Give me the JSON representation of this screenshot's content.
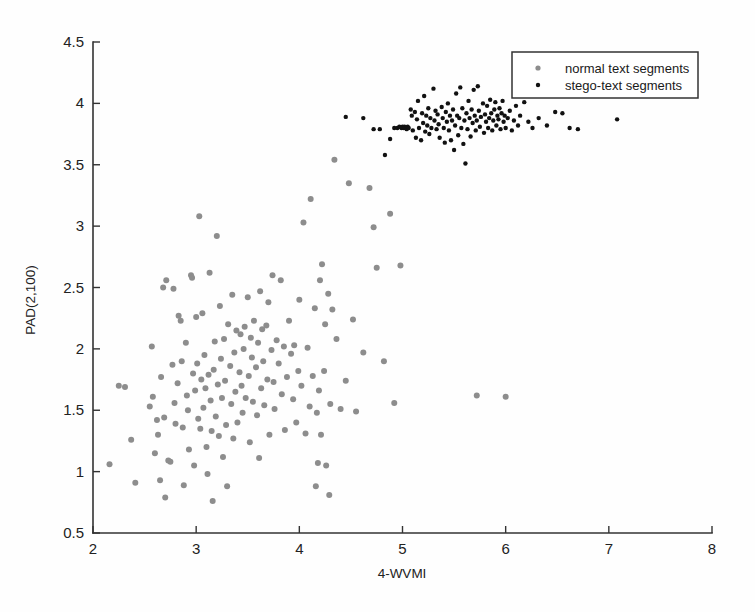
{
  "chart_data": {
    "type": "scatter",
    "title": "",
    "xlabel": "4-WVMI",
    "ylabel": "PAD(2,100)",
    "xlim": [
      2,
      8
    ],
    "ylim": [
      0.5,
      4.5
    ],
    "xticks": [
      "2",
      "3",
      "4",
      "5",
      "6",
      "7",
      "8"
    ],
    "yticks": [
      "0.5",
      "1",
      "1.5",
      "2",
      "2.5",
      "3",
      "3.5",
      "4",
      "4.5"
    ],
    "xtick_values": [
      2,
      3,
      4,
      5,
      6,
      7,
      8
    ],
    "ytick_values": [
      0.5,
      1,
      1.5,
      2,
      2.5,
      3,
      3.5,
      4,
      4.5
    ],
    "grid": false,
    "legend_position": "upper right",
    "series": [
      {
        "name": "normal text segments",
        "marker": "circle",
        "color": "#8d8d8d",
        "points": [
          [
            2.16,
            1.06
          ],
          [
            2.25,
            1.7
          ],
          [
            2.31,
            1.69
          ],
          [
            2.37,
            1.26
          ],
          [
            2.41,
            0.91
          ],
          [
            2.55,
            1.53
          ],
          [
            2.57,
            2.02
          ],
          [
            2.58,
            1.61
          ],
          [
            2.6,
            1.15
          ],
          [
            2.62,
            1.42
          ],
          [
            2.63,
            1.3
          ],
          [
            2.65,
            0.93
          ],
          [
            2.66,
            1.77
          ],
          [
            2.68,
            2.5
          ],
          [
            2.69,
            1.44
          ],
          [
            2.7,
            0.79
          ],
          [
            2.71,
            2.56
          ],
          [
            2.73,
            1.09
          ],
          [
            2.75,
            1.08
          ],
          [
            2.77,
            1.87
          ],
          [
            2.78,
            2.49
          ],
          [
            2.79,
            1.56
          ],
          [
            2.8,
            1.39
          ],
          [
            2.82,
            1.72
          ],
          [
            2.83,
            2.27
          ],
          [
            2.85,
            2.23
          ],
          [
            2.86,
            1.9
          ],
          [
            2.87,
            1.36
          ],
          [
            2.88,
            0.89
          ],
          [
            2.9,
            2.05
          ],
          [
            2.91,
            1.62
          ],
          [
            2.92,
            1.5
          ],
          [
            2.93,
            1.18
          ],
          [
            2.95,
            2.6
          ],
          [
            2.96,
            2.58
          ],
          [
            2.97,
            1.8
          ],
          [
            2.98,
            1.05
          ],
          [
            2.99,
            1.66
          ],
          [
            3.0,
            2.26
          ],
          [
            3.01,
            1.88
          ],
          [
            3.02,
            1.43
          ],
          [
            3.03,
            3.08
          ],
          [
            3.04,
            1.35
          ],
          [
            3.05,
            1.75
          ],
          [
            3.06,
            2.29
          ],
          [
            3.07,
            1.52
          ],
          [
            3.08,
            1.95
          ],
          [
            3.09,
            1.68
          ],
          [
            3.1,
            1.2
          ],
          [
            3.11,
            0.98
          ],
          [
            3.12,
            1.79
          ],
          [
            3.13,
            2.62
          ],
          [
            3.14,
            1.58
          ],
          [
            3.15,
            1.33
          ],
          [
            3.16,
            0.76
          ],
          [
            3.17,
            1.83
          ],
          [
            3.18,
            2.06
          ],
          [
            3.19,
            1.45
          ],
          [
            3.2,
            2.92
          ],
          [
            3.21,
            1.71
          ],
          [
            3.22,
            1.29
          ],
          [
            3.23,
            2.35
          ],
          [
            3.24,
            1.92
          ],
          [
            3.25,
            1.6
          ],
          [
            3.26,
            1.12
          ],
          [
            3.27,
            2.08
          ],
          [
            3.28,
            1.74
          ],
          [
            3.29,
            1.38
          ],
          [
            3.3,
            0.88
          ],
          [
            3.31,
            2.2
          ],
          [
            3.33,
            1.86
          ],
          [
            3.34,
            1.55
          ],
          [
            3.35,
            2.44
          ],
          [
            3.36,
            1.27
          ],
          [
            3.37,
            1.97
          ],
          [
            3.38,
            1.65
          ],
          [
            3.39,
            2.15
          ],
          [
            3.4,
            1.4
          ],
          [
            3.42,
            1.81
          ],
          [
            3.43,
            2.12
          ],
          [
            3.44,
            1.7
          ],
          [
            3.45,
            1.48
          ],
          [
            3.46,
            2.0
          ],
          [
            3.47,
            2.18
          ],
          [
            3.48,
            1.6
          ],
          [
            3.5,
            2.42
          ],
          [
            3.51,
            1.78
          ],
          [
            3.52,
            1.24
          ],
          [
            3.53,
            2.09
          ],
          [
            3.54,
            1.93
          ],
          [
            3.55,
            1.57
          ],
          [
            3.56,
            2.23
          ],
          [
            3.58,
            1.85
          ],
          [
            3.59,
            1.46
          ],
          [
            3.6,
            2.05
          ],
          [
            3.61,
            1.11
          ],
          [
            3.62,
            2.47
          ],
          [
            3.63,
            1.68
          ],
          [
            3.64,
            2.16
          ],
          [
            3.65,
            1.9
          ],
          [
            3.66,
            1.54
          ],
          [
            3.68,
            2.19
          ],
          [
            3.69,
            1.75
          ],
          [
            3.7,
            2.38
          ],
          [
            3.71,
            1.3
          ],
          [
            3.73,
            1.99
          ],
          [
            3.74,
            2.6
          ],
          [
            3.75,
            1.73
          ],
          [
            3.76,
            1.51
          ],
          [
            3.78,
            2.07
          ],
          [
            3.8,
            1.88
          ],
          [
            3.82,
            2.56
          ],
          [
            3.83,
            1.63
          ],
          [
            3.85,
            2.02
          ],
          [
            3.86,
            1.34
          ],
          [
            3.88,
            1.77
          ],
          [
            3.9,
            2.23
          ],
          [
            3.92,
            1.96
          ],
          [
            3.94,
            1.59
          ],
          [
            3.95,
            2.03
          ],
          [
            3.97,
            1.4
          ],
          [
            3.99,
            1.82
          ],
          [
            4.0,
            2.4
          ],
          [
            4.02,
            1.7
          ],
          [
            4.04,
            3.03
          ],
          [
            4.06,
            1.31
          ],
          [
            4.08,
            2.01
          ],
          [
            4.1,
            1.53
          ],
          [
            4.11,
            3.22
          ],
          [
            4.13,
            1.78
          ],
          [
            4.15,
            2.33
          ],
          [
            4.16,
            0.88
          ],
          [
            4.17,
            1.48
          ],
          [
            4.18,
            1.07
          ],
          [
            4.19,
            1.66
          ],
          [
            4.2,
            2.56
          ],
          [
            4.21,
            1.3
          ],
          [
            4.22,
            2.69
          ],
          [
            4.24,
            1.82
          ],
          [
            4.25,
            2.2
          ],
          [
            4.26,
            1.05
          ],
          [
            4.28,
            2.45
          ],
          [
            4.29,
            0.81
          ],
          [
            4.3,
            1.55
          ],
          [
            4.32,
            2.32
          ],
          [
            4.34,
            3.54
          ],
          [
            4.36,
            2.08
          ],
          [
            4.4,
            1.51
          ],
          [
            4.45,
            1.74
          ],
          [
            4.48,
            3.35
          ],
          [
            4.52,
            2.24
          ],
          [
            4.55,
            1.49
          ],
          [
            4.62,
            1.97
          ],
          [
            4.68,
            3.31
          ],
          [
            4.72,
            2.99
          ],
          [
            4.75,
            2.66
          ],
          [
            4.82,
            1.9
          ],
          [
            4.88,
            3.1
          ],
          [
            4.92,
            1.56
          ],
          [
            4.98,
            2.68
          ],
          [
            5.72,
            1.62
          ],
          [
            6.0,
            1.61
          ]
        ]
      },
      {
        "name": "stego-text segments",
        "marker": "dot",
        "color": "#111111",
        "points": [
          [
            4.45,
            3.89
          ],
          [
            4.62,
            3.88
          ],
          [
            4.72,
            3.79
          ],
          [
            4.78,
            3.79
          ],
          [
            4.83,
            3.58
          ],
          [
            4.88,
            3.71
          ],
          [
            4.92,
            3.8
          ],
          [
            4.95,
            3.8
          ],
          [
            4.97,
            3.81
          ],
          [
            4.99,
            3.8
          ],
          [
            5.0,
            3.81
          ],
          [
            5.01,
            3.8
          ],
          [
            5.02,
            3.81
          ],
          [
            5.03,
            3.8
          ],
          [
            5.04,
            3.79
          ],
          [
            5.05,
            3.81
          ],
          [
            5.06,
            3.8
          ],
          [
            5.08,
            3.95
          ],
          [
            5.09,
            3.9
          ],
          [
            5.1,
            3.78
          ],
          [
            5.12,
            3.93
          ],
          [
            5.13,
            3.72
          ],
          [
            5.14,
            3.87
          ],
          [
            5.15,
            4.02
          ],
          [
            5.16,
            3.8
          ],
          [
            5.18,
            3.7
          ],
          [
            5.19,
            3.92
          ],
          [
            5.2,
            3.84
          ],
          [
            5.21,
            4.06
          ],
          [
            5.22,
            3.77
          ],
          [
            5.23,
            3.9
          ],
          [
            5.24,
            3.82
          ],
          [
            5.25,
            3.96
          ],
          [
            5.26,
            3.75
          ],
          [
            5.27,
            3.88
          ],
          [
            5.28,
            3.8
          ],
          [
            5.3,
            4.12
          ],
          [
            5.31,
            3.86
          ],
          [
            5.32,
            3.94
          ],
          [
            5.33,
            3.79
          ],
          [
            5.34,
            3.91
          ],
          [
            5.35,
            3.83
          ],
          [
            5.36,
            3.72
          ],
          [
            5.38,
            3.97
          ],
          [
            5.39,
            3.88
          ],
          [
            5.4,
            3.8
          ],
          [
            5.41,
            3.68
          ],
          [
            5.42,
            3.93
          ],
          [
            5.43,
            3.85
          ],
          [
            5.44,
            4.0
          ],
          [
            5.45,
            3.78
          ],
          [
            5.46,
            3.9
          ],
          [
            5.47,
            3.7
          ],
          [
            5.48,
            3.86
          ],
          [
            5.49,
            3.95
          ],
          [
            5.5,
            3.62
          ],
          [
            5.51,
            3.82
          ],
          [
            5.52,
            4.08
          ],
          [
            5.53,
            3.9
          ],
          [
            5.54,
            3.74
          ],
          [
            5.55,
            3.88
          ],
          [
            5.56,
            4.13
          ],
          [
            5.57,
            3.8
          ],
          [
            5.58,
            3.96
          ],
          [
            5.59,
            3.67
          ],
          [
            5.6,
            3.86
          ],
          [
            5.61,
            3.51
          ],
          [
            5.62,
            3.92
          ],
          [
            5.63,
            3.79
          ],
          [
            5.64,
            4.02
          ],
          [
            5.65,
            3.88
          ],
          [
            5.66,
            3.73
          ],
          [
            5.67,
            3.95
          ],
          [
            5.68,
            3.84
          ],
          [
            5.69,
            4.11
          ],
          [
            5.7,
            3.9
          ],
          [
            5.71,
            3.78
          ],
          [
            5.72,
            3.86
          ],
          [
            5.73,
            4.14
          ],
          [
            5.74,
            3.94
          ],
          [
            5.75,
            3.81
          ],
          [
            5.76,
            3.89
          ],
          [
            5.78,
            4.0
          ],
          [
            5.79,
            3.76
          ],
          [
            5.8,
            3.91
          ],
          [
            5.81,
            3.85
          ],
          [
            5.82,
            3.98
          ],
          [
            5.83,
            3.8
          ],
          [
            5.84,
            3.88
          ],
          [
            5.85,
            4.03
          ],
          [
            5.86,
            3.92
          ],
          [
            5.87,
            3.78
          ],
          [
            5.88,
            3.86
          ],
          [
            5.89,
            3.95
          ],
          [
            5.9,
            4.01
          ],
          [
            5.91,
            3.82
          ],
          [
            5.92,
            3.9
          ],
          [
            5.93,
            3.87
          ],
          [
            5.94,
            3.96
          ],
          [
            5.95,
            3.79
          ],
          [
            5.96,
            3.92
          ],
          [
            5.97,
            4.02
          ],
          [
            5.98,
            3.85
          ],
          [
            5.99,
            3.9
          ],
          [
            6.0,
            3.8
          ],
          [
            6.02,
            3.88
          ],
          [
            6.04,
            3.94
          ],
          [
            6.06,
            3.78
          ],
          [
            6.08,
            3.86
          ],
          [
            6.1,
            3.98
          ],
          [
            6.12,
            3.82
          ],
          [
            6.14,
            3.9
          ],
          [
            6.18,
            4.01
          ],
          [
            6.22,
            3.85
          ],
          [
            6.26,
            3.8
          ],
          [
            6.32,
            3.88
          ],
          [
            6.4,
            3.82
          ],
          [
            6.48,
            3.93
          ],
          [
            6.55,
            3.92
          ],
          [
            6.62,
            3.8
          ],
          [
            6.7,
            3.79
          ],
          [
            7.08,
            3.87
          ]
        ]
      }
    ]
  },
  "legend": {
    "items": [
      {
        "label": "normal text segments",
        "marker_color": "#8d8d8d"
      },
      {
        "label": "stego-text segments",
        "marker_color": "#111111"
      }
    ]
  }
}
